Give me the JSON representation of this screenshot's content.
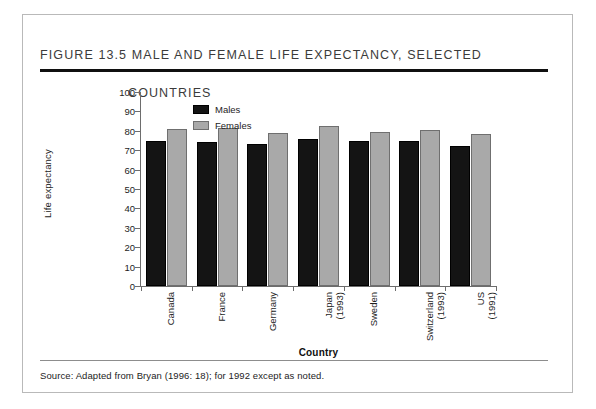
{
  "figure": {
    "title_line1": "Figure 13.5  Male and Female Life Expectancy, Selected",
    "title_line2": "Countries",
    "source_note": "Source:  Adapted from Bryan (1996: 18); for 1992 except as noted."
  },
  "legend": {
    "males_label": "Males",
    "females_label": "Females"
  },
  "colors": {
    "males": "#141414",
    "females": "#a9a9a9",
    "axis": "#6d6d6d",
    "rule": "#101010",
    "text": "#1d1d1d"
  },
  "chart_data": {
    "type": "bar",
    "title": "Figure 13.5  Male and Female Life Expectancy, Selected Countries",
    "xlabel": "Country",
    "ylabel": "Life expectancy",
    "ylim": [
      0,
      100
    ],
    "yticks": [
      0,
      10,
      20,
      30,
      40,
      50,
      60,
      70,
      80,
      90,
      100
    ],
    "ytick_labels": [
      "0",
      "10",
      "20",
      "30",
      "40",
      "50",
      "60",
      "70",
      "80",
      "90",
      "100"
    ],
    "grid": false,
    "legend_position": "upper-left-inside",
    "categories": [
      "Canada",
      "France",
      "Germany",
      "Japan\n(1993)",
      "Sweden",
      "Switzerland\n(1993)",
      "US\n(1991)"
    ],
    "series": [
      {
        "name": "Males",
        "values": [
          75,
          74,
          73,
          76,
          75,
          74.5,
          72
        ]
      },
      {
        "name": "Females",
        "values": [
          81,
          81.5,
          79,
          82.5,
          79.5,
          80.5,
          78.5
        ]
      }
    ]
  }
}
